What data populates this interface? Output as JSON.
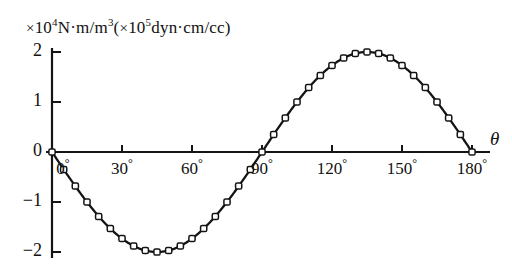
{
  "figure": {
    "title": "",
    "y_unit_label": {
      "full": "× 10⁴N·m/m³ ( × 10⁵dyn·cm/cc)",
      "times1": "×",
      "base1": "10",
      "exp1": "4",
      "mid": "N·m/m",
      "exp_m3": "3",
      "paren_open": "(",
      "times2": "×",
      "base2": "10",
      "exp2": "5",
      "tail": "dyn·cm/cc",
      "paren_close": ")"
    },
    "x_axis_symbol": "θ"
  },
  "chart_data": {
    "type": "line",
    "title": "",
    "xlabel": "θ",
    "ylabel": "× 10⁴N·m/m³ ( × 10⁵dyn·cm/cc)",
    "xlim": [
      0,
      180
    ],
    "ylim": [
      -2.2,
      2.2
    ],
    "grid": false,
    "legend": null,
    "marker": "open-square",
    "xtick_labels": [
      "0°",
      "30°",
      "60°",
      "90°",
      "120°",
      "150°",
      "180°"
    ],
    "xticks": [
      0,
      30,
      60,
      90,
      120,
      150,
      180
    ],
    "ytick_labels": [
      "2",
      "1",
      "0",
      "−1",
      "−2"
    ],
    "yticks": [
      2,
      1,
      0,
      -1,
      -2
    ],
    "series": [
      {
        "name": "magnetostriction torque",
        "formula": "y = -2 sin(2θ)",
        "x": [
          0,
          5,
          10,
          15,
          20,
          25,
          30,
          35,
          40,
          45,
          50,
          55,
          60,
          65,
          70,
          75,
          80,
          85,
          90,
          95,
          100,
          105,
          110,
          115,
          120,
          125,
          130,
          135,
          140,
          145,
          150,
          155,
          160,
          165,
          170,
          175,
          180
        ],
        "y": [
          0.0,
          -0.35,
          -0.68,
          -1.0,
          -1.29,
          -1.53,
          -1.73,
          -1.88,
          -1.97,
          -2.0,
          -1.97,
          -1.88,
          -1.73,
          -1.53,
          -1.29,
          -1.0,
          -0.68,
          -0.35,
          0.0,
          0.35,
          0.68,
          1.0,
          1.29,
          1.53,
          1.73,
          1.88,
          1.97,
          2.0,
          1.97,
          1.88,
          1.73,
          1.53,
          1.29,
          1.0,
          0.68,
          0.35,
          0.0
        ]
      }
    ]
  },
  "colors": {
    "curve": "#141414",
    "axis": "#141414",
    "marker_fill": "#ffffff",
    "background": "#ffffff"
  }
}
